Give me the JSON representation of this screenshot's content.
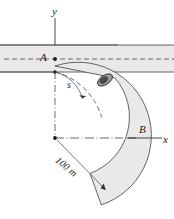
{
  "figure": {
    "labels": {
      "y_axis": "y",
      "x_axis": "x",
      "point_a": "A",
      "point_b": "B",
      "arc_length": "s",
      "radius": "100 m"
    },
    "colors": {
      "road_fill": "#e9e9e9",
      "road_edge": "#5a5a5a",
      "axis": "#333333",
      "dash_line": "#444444",
      "car_body": "#8f8f8f",
      "car_outline": "#3a3a3a",
      "background": "#ffffff"
    },
    "geometry": {
      "center_x": 55,
      "center_y": 138,
      "radius_inner": 60,
      "radius_outer": 72,
      "straight_band_top": 45,
      "straight_band_bottom": 72,
      "radius_value": 100,
      "radius_units": "m"
    }
  }
}
